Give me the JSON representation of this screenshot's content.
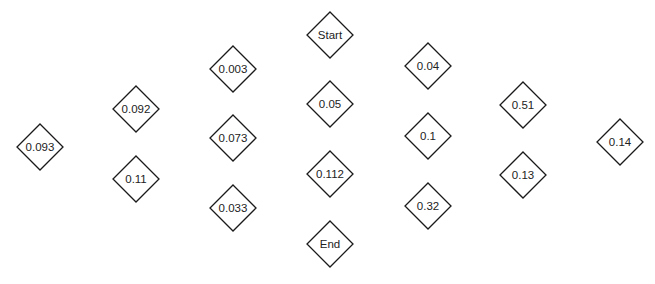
{
  "diagram": {
    "type": "diamond-node-layout",
    "columns": [
      {
        "nodes": [
          {
            "id": "n0093",
            "label": "0.093"
          }
        ]
      },
      {
        "nodes": [
          {
            "id": "n0092",
            "label": "0.092"
          },
          {
            "id": "n011",
            "label": "0.11"
          }
        ]
      },
      {
        "nodes": [
          {
            "id": "n0003",
            "label": "0.003"
          },
          {
            "id": "n0073",
            "label": "0.073"
          },
          {
            "id": "n0033",
            "label": "0.033"
          }
        ]
      },
      {
        "nodes": [
          {
            "id": "start",
            "label": "Start"
          },
          {
            "id": "n005",
            "label": "0.05"
          },
          {
            "id": "n0112",
            "label": "0.112"
          },
          {
            "id": "end",
            "label": "End"
          }
        ]
      },
      {
        "nodes": [
          {
            "id": "n004",
            "label": "0.04"
          },
          {
            "id": "n01",
            "label": "0.1"
          },
          {
            "id": "n032",
            "label": "0.32"
          }
        ]
      },
      {
        "nodes": [
          {
            "id": "n051",
            "label": "0.51"
          },
          {
            "id": "n013",
            "label": "0.13"
          }
        ]
      },
      {
        "nodes": [
          {
            "id": "n014",
            "label": "0.14"
          }
        ]
      }
    ],
    "edges": [],
    "colors": {
      "stroke": "#1a1a1a",
      "fill": "#ffffff",
      "text": "#222222"
    }
  }
}
